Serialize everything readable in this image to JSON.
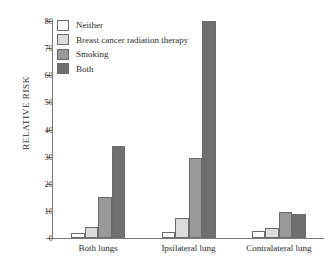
{
  "chart_data": {
    "type": "bar",
    "title": "",
    "xlabel": "",
    "ylabel": "RELATIVE RISK",
    "ylim": [
      0,
      80
    ],
    "yticks": [
      0,
      10,
      20,
      30,
      40,
      50,
      60,
      70,
      80
    ],
    "grid": false,
    "legend_position": "top-left",
    "categories": [
      "Both lungs",
      "Ipsilateral lung",
      "Contralateral lung"
    ],
    "series": [
      {
        "name": "Neither",
        "color": "#ffffff",
        "values": [
          2.0,
          2.3,
          2.5
        ]
      },
      {
        "name": "Breast cancer radiation therapy",
        "color": "#dcdcdc",
        "values": [
          4.0,
          7.3,
          3.7
        ]
      },
      {
        "name": "Smoking",
        "color": "#9a9a9a",
        "values": [
          15.0,
          29.5,
          9.7
        ]
      },
      {
        "name": "Both",
        "color": "#6f6f6f",
        "values": [
          34.0,
          80.0,
          8.8
        ]
      }
    ]
  },
  "axis": {
    "y_title": "RELATIVE RISK",
    "tick_labels": [
      "0",
      "10",
      "20",
      "30",
      "40",
      "50",
      "60",
      "70",
      "80"
    ]
  },
  "legend": {
    "items": [
      {
        "label": "Neither",
        "color": "#ffffff"
      },
      {
        "label": "Breast cancer radiation therapy",
        "color": "#dcdcdc"
      },
      {
        "label": "Smoking",
        "color": "#9a9a9a"
      },
      {
        "label": "Both",
        "color": "#6f6f6f"
      }
    ]
  },
  "x_axis": {
    "labels": [
      "Both lungs",
      "Ipsilateral lung",
      "Contralateral lung"
    ]
  }
}
